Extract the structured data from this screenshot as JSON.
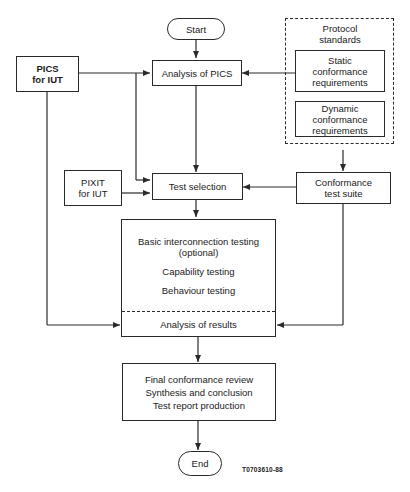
{
  "diagram": {
    "start": "Start",
    "end": "End",
    "pics_for_iut": [
      "PICS",
      "for IUT"
    ],
    "analysis_of_pics": "Analysis of PICS",
    "protocol_standards": {
      "title": [
        "Protocol",
        "standards"
      ],
      "static": [
        "Static",
        "conformance",
        "requirements"
      ],
      "dynamic": [
        "Dynamic",
        "conformance",
        "requirements"
      ]
    },
    "pixit_for_iut": [
      "PIXIT",
      "for IUT"
    ],
    "test_selection": "Test selection",
    "conformance_test_suite": [
      "Conformance",
      "test suite"
    ],
    "testing_box": {
      "basic": [
        "Basic interconnection testing",
        "(optional)"
      ],
      "capability": "Capability testing",
      "behaviour": "Behaviour testing",
      "analysis": "Analysis of results"
    },
    "final_box": [
      "Final conformance review",
      "Synthesis and conclusion",
      "Test report production"
    ],
    "figure_code": "T0703610-88"
  }
}
